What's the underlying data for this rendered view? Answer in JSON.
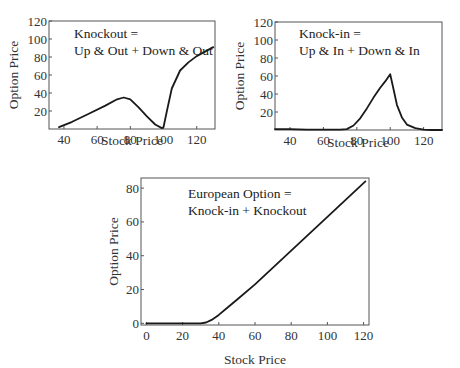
{
  "chart_data": [
    {
      "id": "knockout",
      "type": "line",
      "annotation": [
        "Knockout =",
        "Up & Out + Down & Out"
      ],
      "xlabel": "Stock Price",
      "ylabel": "Option Price",
      "xlim": [
        31,
        131
      ],
      "ylim": [
        0,
        120
      ],
      "xticks": [
        40,
        60,
        80,
        100,
        120
      ],
      "yticks": [
        20,
        40,
        60,
        80,
        100,
        120
      ],
      "grid": false,
      "x": [
        37,
        45,
        55,
        65,
        72,
        76,
        80,
        85,
        90,
        95,
        99,
        100,
        102,
        105,
        110,
        115,
        120,
        125,
        130
      ],
      "y": [
        2,
        8,
        17,
        26,
        33,
        35,
        33,
        24,
        14,
        5,
        1,
        2,
        20,
        45,
        65,
        74,
        81,
        86,
        91
      ]
    },
    {
      "id": "knockin",
      "type": "line",
      "annotation": [
        "Knock-in =",
        "Up & In + Down & In"
      ],
      "xlabel": "Stock Price",
      "ylabel": "Option Price",
      "xlim": [
        31,
        131
      ],
      "ylim": [
        0,
        120
      ],
      "xticks": [
        40,
        60,
        80,
        100,
        120
      ],
      "yticks": [
        20,
        40,
        60,
        80,
        100,
        120
      ],
      "grid": false,
      "x": [
        31,
        40,
        50,
        60,
        70,
        74,
        78,
        82,
        86,
        90,
        94,
        97,
        100,
        102,
        104,
        107,
        110,
        115,
        120,
        125,
        131
      ],
      "y": [
        1,
        1,
        0.5,
        0.5,
        0.5,
        1,
        5,
        13,
        24,
        36,
        47,
        54,
        62,
        45,
        28,
        14,
        6,
        2,
        0.5,
        0,
        0
      ]
    },
    {
      "id": "european",
      "type": "line",
      "annotation": [
        "European Option =",
        "Knock-in + Knockout"
      ],
      "xlabel": "Stock Price",
      "ylabel": "Option Price",
      "xlim": [
        -3,
        123
      ],
      "ylim": [
        -1,
        86
      ],
      "xticks": [
        0,
        20,
        40,
        60,
        80,
        100,
        120
      ],
      "yticks": [
        0,
        20,
        40,
        60,
        80
      ],
      "grid": false,
      "x": [
        0,
        10,
        20,
        30,
        33,
        36,
        40,
        45,
        50,
        60,
        80,
        100,
        121
      ],
      "y": [
        0,
        0,
        0,
        0,
        0.5,
        2,
        5,
        9.5,
        14,
        23,
        43,
        63,
        84
      ]
    }
  ]
}
